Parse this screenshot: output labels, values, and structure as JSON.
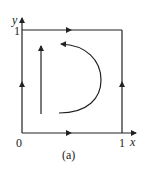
{
  "diagram": {
    "caption": "(a)",
    "axes": {
      "x_label": "x",
      "y_label": "y",
      "origin_label": "0",
      "x_tick_label": "1",
      "y_tick_label": "1"
    },
    "square": {
      "description": "Unit square boundary with flow arrows: bottom edge rightward, right edge upward, top edge rightward, left edge upward"
    },
    "interior_flows": [
      {
        "type": "straight",
        "direction": "up"
      },
      {
        "type": "curved",
        "direction": "counterclockwise arc from bottom to top"
      }
    ],
    "colors": {
      "line": "#222222",
      "background": "#ffffff"
    }
  }
}
